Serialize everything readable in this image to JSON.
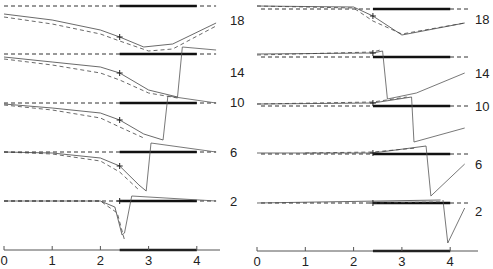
{
  "chart_data": [
    {
      "type": "line",
      "panel": "left",
      "title": "",
      "xlabel": "",
      "ylabel": "",
      "x_ticks": [
        "0",
        "1",
        "2",
        "3",
        "4"
      ],
      "xlim": [
        0,
        4.5
      ],
      "grid": false,
      "thick_bar_range": [
        2.4,
        4.0
      ],
      "marker": "+ at x≈2.4 on solid curve",
      "traces": [
        {
          "label": "18",
          "baseline_y": 6,
          "solid": [
            [
              0,
              14
            ],
            [
              1,
              20
            ],
            [
              2,
              30
            ],
            [
              2.4,
              37
            ],
            [
              2.9,
              47
            ],
            [
              3.5,
              44
            ],
            [
              4.4,
              23
            ]
          ],
          "dashed": [
            [
              0,
              17
            ],
            [
              1,
              24
            ],
            [
              2,
              34
            ],
            [
              2.4,
              41
            ],
            [
              3,
              51
            ],
            [
              3.5,
              49
            ],
            [
              4.4,
              26
            ]
          ]
        },
        {
          "label": "14",
          "baseline_y": 54,
          "solid": [
            [
              0,
              57
            ],
            [
              1,
              62
            ],
            [
              2,
              67
            ],
            [
              2.4,
              73
            ],
            [
              3,
              90
            ],
            [
              3.6,
              97
            ]
          ],
          "dashed": [
            [
              0,
              59
            ],
            [
              1,
              65
            ],
            [
              2,
              73
            ],
            [
              2.4,
              80
            ],
            [
              3,
              93
            ],
            [
              3.6,
              98
            ]
          ],
          "jump": [
            [
              3.6,
              97
            ],
            [
              3.7,
              47
            ],
            [
              4.4,
              50
            ]
          ]
        },
        {
          "label": "10",
          "baseline_y": 103,
          "solid": [
            [
              0,
              104
            ],
            [
              1,
              108
            ],
            [
              2,
              113
            ],
            [
              2.4,
              120
            ],
            [
              2.9,
              134
            ],
            [
              3.3,
              140
            ]
          ],
          "dashed": [
            [
              0,
              105
            ],
            [
              1,
              110
            ],
            [
              2,
              118
            ],
            [
              2.4,
              127
            ],
            [
              2.9,
              138
            ]
          ],
          "jump": [
            [
              3.3,
              140
            ],
            [
              3.4,
              96
            ],
            [
              4.4,
              103
            ]
          ]
        },
        {
          "label": "6",
          "baseline_y": 152,
          "solid": [
            [
              0,
              152
            ],
            [
              1,
              153
            ],
            [
              2,
              158
            ],
            [
              2.4,
              166
            ],
            [
              2.8,
              185
            ],
            [
              2.95,
              191
            ]
          ],
          "dashed": [
            [
              0,
              152
            ],
            [
              1,
              154
            ],
            [
              2,
              161
            ],
            [
              2.4,
              172
            ],
            [
              2.8,
              190
            ]
          ],
          "jump": [
            [
              2.95,
              191
            ],
            [
              3.05,
              143
            ],
            [
              4.4,
              152
            ]
          ]
        },
        {
          "label": "2",
          "baseline_y": 201,
          "solid": [
            [
              0,
              201
            ],
            [
              2,
              201
            ],
            [
              2.3,
              207
            ],
            [
              2.45,
              235
            ],
            [
              2.5,
              233
            ]
          ],
          "dashed": [
            [
              0,
              201
            ],
            [
              2,
              201
            ],
            [
              2.35,
              213
            ],
            [
              2.5,
              240
            ]
          ],
          "jump": [
            [
              2.5,
              233
            ],
            [
              2.65,
              196
            ],
            [
              4.4,
              201
            ]
          ]
        }
      ]
    },
    {
      "type": "line",
      "panel": "right",
      "title": "",
      "xlabel": "",
      "ylabel": "",
      "x_ticks": [
        "0",
        "1",
        "2",
        "3",
        "4"
      ],
      "xlim": [
        0,
        4.5
      ],
      "grid": false,
      "thick_bar_range": [
        2.4,
        4.0
      ],
      "marker": "+ at x≈2.4",
      "traces": [
        {
          "label": "18",
          "baseline_y": 9,
          "solid": [
            [
              0,
              6
            ],
            [
              2,
              7
            ],
            [
              2.4,
              16
            ],
            [
              3,
              35
            ],
            [
              4.3,
              23
            ]
          ],
          "dashed": [
            [
              0,
              6
            ],
            [
              2,
              8
            ],
            [
              2.4,
              21
            ],
            [
              3,
              34
            ],
            [
              4.3,
              23
            ]
          ]
        },
        {
          "label": "14",
          "baseline_y": 57,
          "solid": [
            [
              0,
              54
            ],
            [
              2.4,
              53
            ],
            [
              2.6,
              51
            ]
          ],
          "dashed": [
            [
              0,
              55
            ],
            [
              2.4,
              52
            ],
            [
              2.55,
              50
            ]
          ],
          "jump": [
            [
              2.6,
              51
            ],
            [
              2.7,
              99
            ],
            [
              3.3,
              93
            ],
            [
              4.3,
              73
            ]
          ]
        },
        {
          "label": "10",
          "baseline_y": 106,
          "solid": [
            [
              0,
              104
            ],
            [
              2.4,
              103
            ],
            [
              3.2,
              97
            ]
          ],
          "dashed": [
            [
              0,
              104
            ],
            [
              2.4,
              102
            ],
            [
              3.1,
              97
            ]
          ],
          "jump": [
            [
              3.2,
              97
            ],
            [
              3.25,
              142
            ],
            [
              4.3,
              128
            ]
          ]
        },
        {
          "label": "6",
          "baseline_y": 154,
          "solid": [
            [
              0,
              153
            ],
            [
              2.4,
              153
            ],
            [
              3.5,
              146
            ]
          ],
          "dashed": [
            [
              1,
              153
            ],
            [
              2.4,
              152
            ],
            [
              3.3,
              148
            ]
          ],
          "jump": [
            [
              3.5,
              146
            ],
            [
              3.6,
              196
            ],
            [
              4.3,
              164
            ]
          ]
        },
        {
          "label": "2",
          "baseline_y": 203,
          "solid": [
            [
              0,
              203
            ],
            [
              3.8,
              200
            ]
          ],
          "dashed": [
            [
              2.4,
              203
            ],
            [
              3.8,
              202
            ]
          ],
          "jump": [
            [
              3.85,
              200
            ],
            [
              3.95,
              243
            ],
            [
              4.3,
              208
            ]
          ]
        }
      ]
    }
  ],
  "labels": {
    "left": [
      "18",
      "14",
      "10",
      "6",
      "2"
    ],
    "right": [
      "18",
      "14",
      "10",
      "6",
      "2"
    ]
  },
  "axis": {
    "left_ticks": [
      "0",
      "1",
      "2",
      "3",
      "4"
    ],
    "right_ticks": [
      "0",
      "1",
      "2",
      "3",
      "4"
    ]
  }
}
